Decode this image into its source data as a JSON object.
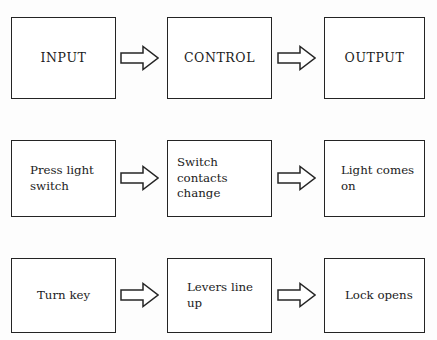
{
  "diagram": {
    "background_color": "#fdfdfd",
    "line_color": "#242424",
    "fill_color": "#ffffff",
    "connector_icon": "right-block-arrow-icon",
    "rows": [
      {
        "name": "generic-system",
        "nodes": [
          {
            "label": "INPUT"
          },
          {
            "label": "CONTROL"
          },
          {
            "label": "OUTPUT"
          }
        ]
      },
      {
        "name": "light-switch-example",
        "nodes": [
          {
            "label": "Press light\nswitch"
          },
          {
            "label": "Switch contacts\nchange"
          },
          {
            "label": "Light comes\non"
          }
        ]
      },
      {
        "name": "lock-and-key-example",
        "nodes": [
          {
            "label": "Turn key"
          },
          {
            "label": "Levers line\nup"
          },
          {
            "label": "Lock opens"
          }
        ]
      }
    ]
  }
}
